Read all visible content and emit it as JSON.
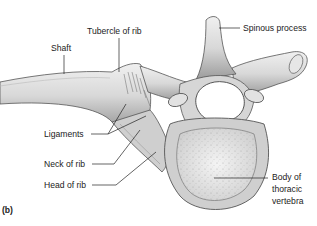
{
  "figure": {
    "panel_label": "(b)",
    "labels": {
      "tubercle": "Tubercle of rib",
      "shaft": "Shaft",
      "spinous": "Spinous process",
      "ligaments": "Ligaments",
      "neck": "Neck of rib",
      "head": "Head of rib",
      "body_line1": "Body of",
      "body_line2": "thoracic",
      "body_line3": "vertebra"
    }
  }
}
